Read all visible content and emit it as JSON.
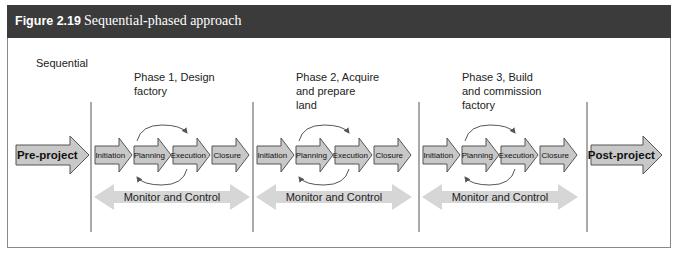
{
  "figure": {
    "number_label": "Figure 2.19",
    "title": "Sequential-phased approach"
  },
  "approach_label": "Sequential",
  "pre_project": "Pre-project",
  "post_project": "Post-project",
  "phases": [
    {
      "title_lines": [
        "Phase 1, Design",
        "factory"
      ],
      "steps": [
        "Initiation",
        "Planning",
        "Execution",
        "Closure"
      ],
      "monitor_label": "Monitor and Control"
    },
    {
      "title_lines": [
        "Phase 2, Acquire",
        "and prepare",
        "land"
      ],
      "steps": [
        "Initiation",
        "Planning",
        "Execution",
        "Closure"
      ],
      "monitor_label": "Monitor and Control"
    },
    {
      "title_lines": [
        "Phase 3, Build",
        "and commission",
        "factory"
      ],
      "steps": [
        "Initiation",
        "Planning",
        "Execution",
        "Closure"
      ],
      "monitor_label": "Monitor and Control"
    }
  ],
  "colors": {
    "header_bg": "#3b3b3b",
    "step_fill": "#c8c8c8",
    "step_stroke": "#555555",
    "monitor_fill": "#d6d6d6"
  }
}
